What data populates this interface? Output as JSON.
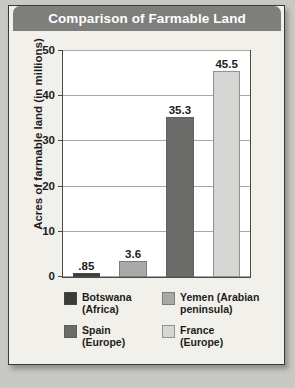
{
  "title": "Comparison of Farmable Land",
  "chart_data": {
    "type": "bar",
    "title": "Comparison of Farmable Land",
    "xlabel": "",
    "ylabel": "Acres of farmable land (in millions)",
    "ylim": [
      0,
      50
    ],
    "yticks": [
      "0",
      "10",
      "20",
      "30",
      "40",
      "50"
    ],
    "grid": true,
    "legend_position": "bottom",
    "categories": [
      "Botswana (Africa)",
      "Yemen (Arabian peninsula)",
      "Spain (Europe)",
      "France (Europe)"
    ],
    "values": [
      0.85,
      3.6,
      35.3,
      45.5
    ],
    "value_labels": [
      ".85",
      "3.6",
      "35.3",
      "45.5"
    ],
    "colors": [
      "#3b3b39",
      "#a9a9a7",
      "#6b6b69",
      "#d6d6d4"
    ]
  },
  "legend": {
    "items": [
      {
        "label": "Botswana\n(Africa)",
        "line1": "Botswana",
        "line2": "(Africa)",
        "color": "#3b3b39"
      },
      {
        "label": "Yemen (Arabian peninsula)",
        "line1": "Yemen (Arabian",
        "line2": "peninsula)",
        "color": "#a9a9a7"
      },
      {
        "label": "Spain (Europe)",
        "line1": "Spain",
        "line2": "(Europe)",
        "color": "#6b6b69"
      },
      {
        "label": "France (Europe)",
        "line1": "France",
        "line2": "(Europe)",
        "color": "#d6d6d4"
      }
    ]
  }
}
